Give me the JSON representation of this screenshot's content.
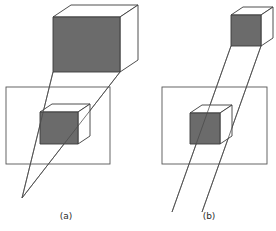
{
  "figure": {
    "background_color": "#ffffff",
    "width": 276,
    "height": 231,
    "stroke_color": "#3a3a3a",
    "shaded_face_color": "#6b6b6b",
    "unshaded_face_color": "#ffffff",
    "ray_color": "#4a4a4a",
    "plane_border_color": "#555555"
  },
  "panels": [
    {
      "id": "a",
      "caption": "(a)",
      "caption_x": 66,
      "caption_y": 219,
      "projection_type": "perspective",
      "description": "Projection rays converge to a single center of projection below the image plane, so the projected cube is smaller than the object cube.",
      "object_cube": {
        "name": "object-cube",
        "front_face_shaded": true,
        "front_face": [
          [
            53,
            17
          ],
          [
            53,
            72
          ],
          [
            120,
            72
          ],
          [
            120,
            17
          ]
        ],
        "top_face": [
          [
            53,
            17
          ],
          [
            71,
            5
          ],
          [
            138,
            5
          ],
          [
            120,
            17
          ]
        ],
        "right_face": [
          [
            120,
            17
          ],
          [
            138,
            5
          ],
          [
            138,
            60
          ],
          [
            120,
            72
          ]
        ]
      },
      "image_plane": {
        "name": "image-plane",
        "x": 6,
        "y": 87,
        "width": 104,
        "height": 77
      },
      "projected_cube": {
        "name": "projected-cube",
        "front_face_shaded": true,
        "front_face": [
          [
            40,
            112
          ],
          [
            40,
            144
          ],
          [
            78,
            144
          ],
          [
            78,
            112
          ]
        ],
        "top_face": [
          [
            40,
            112
          ],
          [
            52,
            104
          ],
          [
            90,
            104
          ],
          [
            78,
            112
          ]
        ],
        "right_face": [
          [
            78,
            112
          ],
          [
            90,
            104
          ],
          [
            90,
            136
          ],
          [
            78,
            144
          ]
        ]
      },
      "center_of_projection": {
        "x": 22,
        "y": 198,
        "label": ""
      },
      "rays": [
        {
          "name": "ray-left",
          "x1": 53,
          "y1": 72,
          "x2": 22,
          "y2": 198
        },
        {
          "name": "ray-right",
          "x1": 120,
          "y1": 72,
          "x2": 22,
          "y2": 198
        }
      ]
    },
    {
      "id": "b",
      "caption": "(b)",
      "caption_x": 209,
      "caption_y": 219,
      "projection_type": "parallel",
      "description": "Projection rays are parallel, so the projected cube is the same size as the object cube.",
      "object_cube": {
        "name": "object-cube",
        "front_face_shaded": true,
        "front_face": [
          [
            231,
            15
          ],
          [
            231,
            46
          ],
          [
            261,
            46
          ],
          [
            261,
            15
          ]
        ],
        "top_face": [
          [
            231,
            15
          ],
          [
            243,
            7
          ],
          [
            273,
            7
          ],
          [
            261,
            15
          ]
        ],
        "right_face": [
          [
            261,
            15
          ],
          [
            273,
            7
          ],
          [
            273,
            38
          ],
          [
            261,
            46
          ]
        ]
      },
      "image_plane": {
        "name": "image-plane",
        "x": 162,
        "y": 87,
        "width": 105,
        "height": 77
      },
      "projected_cube": {
        "name": "projected-cube",
        "front_face_shaded": true,
        "front_face": [
          [
            190,
            113
          ],
          [
            190,
            144
          ],
          [
            220,
            144
          ],
          [
            220,
            113
          ]
        ],
        "top_face": [
          [
            190,
            113
          ],
          [
            202,
            105
          ],
          [
            232,
            105
          ],
          [
            220,
            113
          ]
        ],
        "right_face": [
          [
            220,
            113
          ],
          [
            232,
            105
          ],
          [
            232,
            136
          ],
          [
            220,
            144
          ]
        ]
      },
      "rays": [
        {
          "name": "ray-left",
          "x1": 231,
          "y1": 46,
          "x2": 172,
          "y2": 212
        },
        {
          "name": "ray-right",
          "x1": 261,
          "y1": 46,
          "x2": 202,
          "y2": 212
        }
      ]
    }
  ]
}
